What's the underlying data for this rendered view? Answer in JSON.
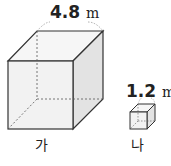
{
  "figure": {
    "cube_a": {
      "label": "가",
      "edge_value": "4.8",
      "unit": "m"
    },
    "cube_b": {
      "label": "나",
      "edge_value": "1.2",
      "unit": "m"
    }
  },
  "colors": {
    "stroke": "#333333",
    "front_face": "#f2f2f2",
    "side_face": "#e2e2e2",
    "top_face": "#f6f6f6"
  }
}
